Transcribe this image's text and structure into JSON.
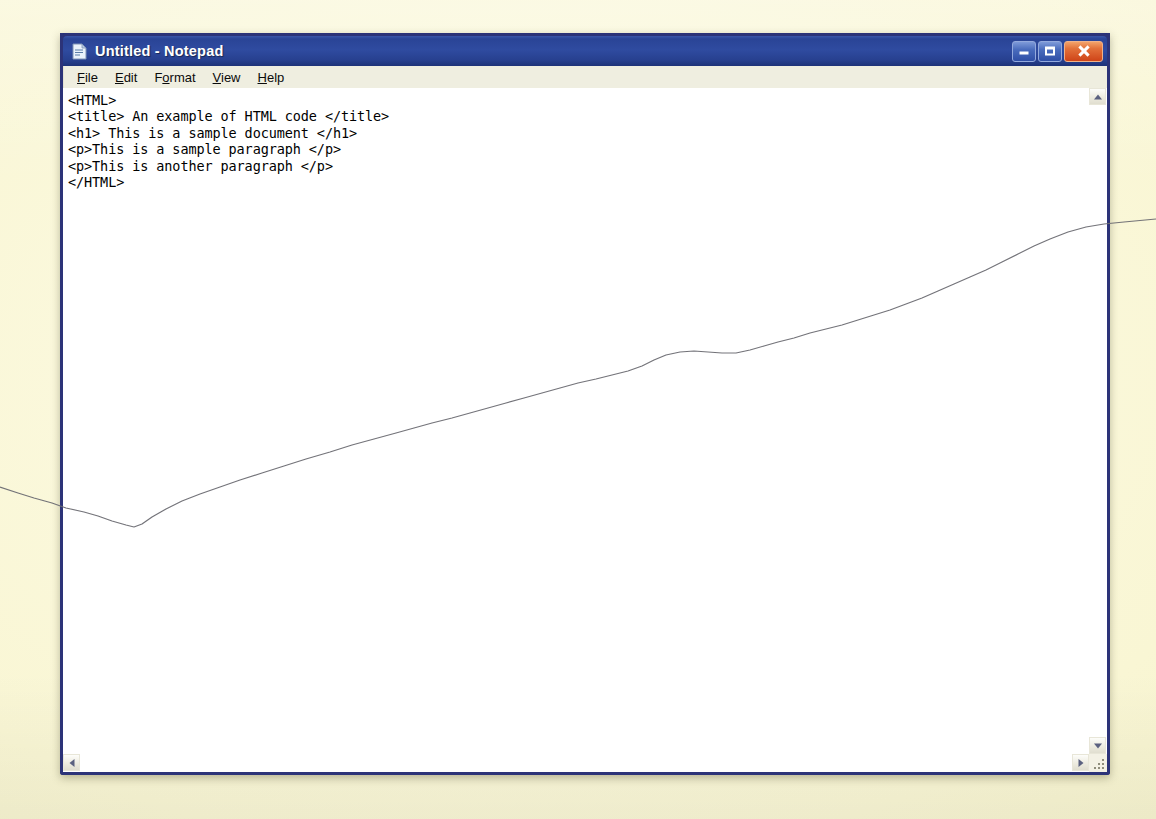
{
  "window": {
    "title": "Untitled - Notepad",
    "icon": "notepad-document-icon",
    "controls": {
      "minimize_label": "Minimize",
      "maximize_label": "Maximize",
      "close_label": "Close"
    }
  },
  "menu": {
    "items": [
      {
        "label": "File",
        "accesskey": "F",
        "pre": "",
        "post": "ile"
      },
      {
        "label": "Edit",
        "accesskey": "E",
        "pre": "",
        "post": "dit"
      },
      {
        "label": "Format",
        "accesskey": "o",
        "pre": "F",
        "post": "rmat"
      },
      {
        "label": "View",
        "accesskey": "V",
        "pre": "",
        "post": "iew"
      },
      {
        "label": "Help",
        "accesskey": "H",
        "pre": "",
        "post": "elp"
      }
    ]
  },
  "editor": {
    "content": "<HTML>\n<title> An example of HTML code </title>\n<h1> This is a sample document </h1>\n<p>This is a sample paragraph </p>\n<p>This is another paragraph </p>\n</HTML>",
    "lines": [
      "<HTML>",
      "<title> An example of HTML code </title>",
      "<h1> This is a sample document </h1>",
      "<p>This is a sample paragraph </p>",
      "<p>This is another paragraph </p>",
      "</HTML>"
    ]
  },
  "scrollbars": {
    "vertical": {
      "up_icon": "chevron-up-icon",
      "down_icon": "chevron-down-icon"
    },
    "horizontal": {
      "left_icon": "chevron-left-icon",
      "right_icon": "chevron-right-icon"
    },
    "resize_grip_icon": "resize-grip-icon"
  },
  "colors": {
    "titlebar_blue": "#2f4ba0",
    "window_border": "#2c3378",
    "close_red": "#cf4418",
    "menu_bar": "#efeee0",
    "page_background": "#f9f6d4",
    "text_black": "#000000",
    "curve_line": "#6b6b72"
  }
}
